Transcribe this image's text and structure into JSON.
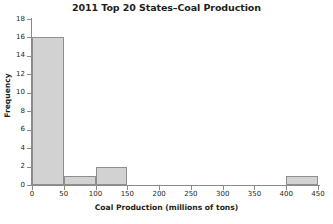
{
  "chart_data": {
    "type": "bar",
    "title": "2011 Top 20 States–Coal Production",
    "xlabel": "Coal Production (millions of tons)",
    "ylabel": "Frequency",
    "grid": false,
    "legend": null,
    "xlim": [
      0,
      450
    ],
    "ylim": [
      0,
      18
    ],
    "bin_width": 50,
    "bin_edges": [
      0,
      50,
      100,
      150,
      200,
      250,
      300,
      350,
      400,
      450
    ],
    "categories": [
      "0-50",
      "50-100",
      "100-150",
      "150-200",
      "200-250",
      "250-300",
      "300-350",
      "350-400",
      "400-450"
    ],
    "values": [
      16,
      1,
      2,
      0,
      0,
      0,
      0,
      0,
      1
    ],
    "xticks": [
      0,
      50,
      100,
      150,
      200,
      250,
      300,
      350,
      400,
      450
    ],
    "xtick_labels": [
      "0",
      "50",
      "100",
      "150",
      "200",
      "250",
      "300",
      "350",
      "400",
      "450"
    ],
    "yticks": [
      0,
      2,
      4,
      6,
      8,
      10,
      12,
      14,
      16,
      18
    ],
    "ytick_labels": [
      "0",
      "2",
      "4",
      "6",
      "8",
      "10",
      "12",
      "14",
      "16",
      "18"
    ],
    "bar_fill_color": "#d2d2d2",
    "bar_edge_color": "#8f8f8f",
    "axis_color": "#8a8a8a",
    "text_color": "#231f20",
    "background_color": "#ffffff"
  }
}
